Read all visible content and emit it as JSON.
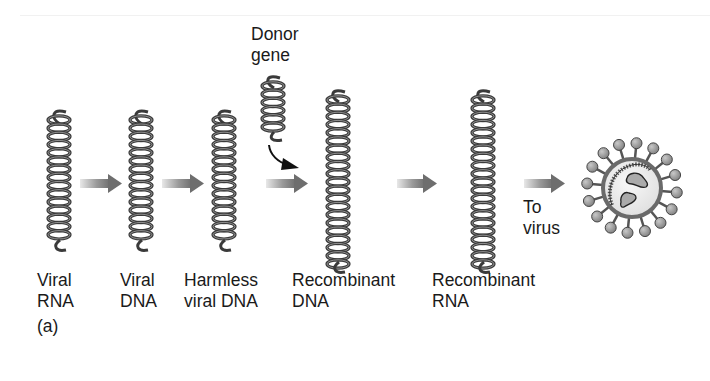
{
  "figure": {
    "panel_label": "(a)",
    "colors": {
      "coil": "#3a3a3a",
      "arrow_dark": "#6e6e6e",
      "arrow_light": "#e6e6e6",
      "curved_arrow": "#111111",
      "virus_envelope": "#6a6a6a",
      "virus_interior": "#ececec",
      "virus_spike": "#9a9a9a"
    },
    "stages": [
      {
        "line1": "Viral",
        "line2": "RNA"
      },
      {
        "line1": "Viral",
        "line2": "DNA"
      },
      {
        "line1": "Harmless",
        "line2": "viral DNA"
      },
      {
        "line1": "Recombinant",
        "line2": "DNA"
      },
      {
        "line1": "Recombinant",
        "line2": "RNA"
      }
    ],
    "donor": {
      "line1": "Donor",
      "line2": "gene"
    },
    "to_virus": {
      "line1": "To",
      "line2": "virus"
    }
  }
}
